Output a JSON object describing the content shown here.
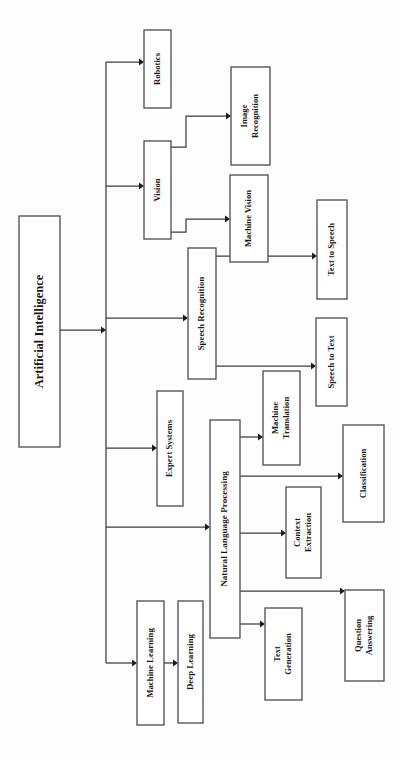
{
  "diagram": {
    "orientation": "rotated-90-ccw",
    "colors": {
      "box_fill": "#ffffff",
      "box_stroke": "#58585a",
      "edge_stroke": "#3b3b3f",
      "text": "#17171a",
      "background": "#fdfdfd"
    },
    "root": {
      "id": "artificial-intelligence",
      "label": "Artificial Intelligence",
      "x": 19,
      "y": 216,
      "w": 41,
      "h": 231,
      "font_size": 12.5,
      "lines": [
        "Artificial Intelligence"
      ]
    },
    "nodes": [
      {
        "id": "robotics",
        "label": "Robotics",
        "x": 144,
        "y": 30,
        "w": 27,
        "h": 78,
        "font_size": 8.6,
        "lines": [
          "Robotics"
        ]
      },
      {
        "id": "vision",
        "label": "Vision",
        "x": 144,
        "y": 141,
        "w": 27,
        "h": 98,
        "font_size": 8.6,
        "lines": [
          "Vision"
        ]
      },
      {
        "id": "image-recognition",
        "label": "Image Recognition",
        "x": 231,
        "y": 67,
        "w": 39,
        "h": 98,
        "font_size": 8.6,
        "lines": [
          "Image",
          "Recognition"
        ]
      },
      {
        "id": "machine-vision",
        "label": "Machine Vision",
        "x": 230,
        "y": 175,
        "w": 38,
        "h": 87,
        "font_size": 8.6,
        "lines": [
          "Machine Vision"
        ]
      },
      {
        "id": "speech-recognition",
        "label": "Speech Recognition",
        "x": 188,
        "y": 248,
        "w": 28,
        "h": 131,
        "font_size": 8.8,
        "lines": [
          "Speech Recognition"
        ]
      },
      {
        "id": "text-to-speech",
        "label": "Text to Speech",
        "x": 317,
        "y": 200,
        "w": 30,
        "h": 99,
        "font_size": 8.6,
        "lines": [
          "Text to Speech"
        ]
      },
      {
        "id": "speech-to-text",
        "label": "Speech to Text",
        "x": 316,
        "y": 318,
        "w": 31,
        "h": 88,
        "font_size": 8.6,
        "lines": [
          "Speech to Text"
        ]
      },
      {
        "id": "expert-systems",
        "label": "Expert Systems",
        "x": 157,
        "y": 391,
        "w": 26,
        "h": 115,
        "font_size": 8.6,
        "lines": [
          "Expert Systems"
        ]
      },
      {
        "id": "natural-language-processing",
        "label": "Natural Language Processing",
        "x": 210,
        "y": 420,
        "w": 30,
        "h": 218,
        "font_size": 9.2,
        "lines": [
          "Natural Language Processing"
        ]
      },
      {
        "id": "machine-translation",
        "label": "Machine Translation",
        "x": 263,
        "y": 371,
        "w": 37,
        "h": 94,
        "font_size": 8.6,
        "lines": [
          "Machine",
          "Translation"
        ]
      },
      {
        "id": "classification",
        "label": "Classification",
        "x": 343,
        "y": 425,
        "w": 41,
        "h": 97,
        "font_size": 8.6,
        "lines": [
          "Classification"
        ]
      },
      {
        "id": "context-extraction",
        "label": "Context Extraction",
        "x": 286,
        "y": 487,
        "w": 35,
        "h": 91,
        "font_size": 8.6,
        "lines": [
          "Context",
          "Extraction"
        ]
      },
      {
        "id": "question-answering",
        "label": "Question Answering",
        "x": 345,
        "y": 590,
        "w": 39,
        "h": 91,
        "font_size": 8.6,
        "lines": [
          "Question",
          "Answering"
        ]
      },
      {
        "id": "text-generation",
        "label": "Text Generation",
        "x": 265,
        "y": 608,
        "w": 37,
        "h": 92,
        "font_size": 8.6,
        "lines": [
          "Text",
          "Generation"
        ]
      },
      {
        "id": "machine-learning",
        "label": "Machine Learning",
        "x": 137,
        "y": 601,
        "w": 27,
        "h": 124,
        "font_size": 8.8,
        "lines": [
          "Machine Learning"
        ]
      },
      {
        "id": "deep-learning",
        "label": "Deep Learning",
        "x": 178,
        "y": 601,
        "w": 25,
        "h": 122,
        "font_size": 8.8,
        "lines": [
          "Deep Learning"
        ]
      }
    ],
    "edges": [
      {
        "id": "ai-to-trunk",
        "from": "artificial-intelligence",
        "to": "trunk",
        "path": "M60,330 L104,330",
        "arrow": {
          "x": 106,
          "y": 330,
          "dir": "right"
        }
      },
      {
        "id": "trunk-spine",
        "from": "trunk",
        "to": "trunk",
        "path": "M106,62 L106,663",
        "arrow": null
      },
      {
        "id": "trunk-to-robotics",
        "from": "trunk",
        "to": "robotics",
        "path": "M106,62 L142,62",
        "arrow": {
          "x": 144,
          "y": 62,
          "dir": "right"
        }
      },
      {
        "id": "trunk-to-vision",
        "from": "trunk",
        "to": "vision",
        "path": "M106,186 L142,186",
        "arrow": {
          "x": 144,
          "y": 186,
          "dir": "right"
        }
      },
      {
        "id": "trunk-to-speech-recognition",
        "from": "trunk",
        "to": "speech-recognition",
        "path": "M106,318 L186,318",
        "arrow": {
          "x": 188,
          "y": 318,
          "dir": "right"
        }
      },
      {
        "id": "trunk-to-expert-systems",
        "from": "trunk",
        "to": "expert-systems",
        "path": "M106,448 L155,448",
        "arrow": {
          "x": 157,
          "y": 448,
          "dir": "right"
        }
      },
      {
        "id": "trunk-to-nlp",
        "from": "trunk",
        "to": "natural-language-processing",
        "path": "M106,527 L208,527",
        "arrow": {
          "x": 210,
          "y": 527,
          "dir": "right"
        }
      },
      {
        "id": "trunk-to-machine-learning",
        "from": "trunk",
        "to": "machine-learning",
        "path": "M106,663 L135,663",
        "arrow": {
          "x": 137,
          "y": 663,
          "dir": "right"
        }
      },
      {
        "id": "vision-to-image-recognition",
        "from": "vision",
        "to": "image-recognition",
        "path": "M171,147 L186,147 L186,116 L229,116",
        "arrow": {
          "x": 231,
          "y": 116,
          "dir": "right"
        }
      },
      {
        "id": "vision-to-machine-vision",
        "from": "vision",
        "to": "machine-vision",
        "path": "M171,232 L186,232 L186,219 L228,219",
        "arrow": {
          "x": 230,
          "y": 219,
          "dir": "right"
        }
      },
      {
        "id": "speech-recognition-to-text-to-speech",
        "from": "speech-recognition",
        "to": "text-to-speech",
        "path": "M216,256 L315,256",
        "arrow": {
          "x": 317,
          "y": 256,
          "dir": "right"
        }
      },
      {
        "id": "speech-recognition-to-speech-to-text",
        "from": "speech-recognition",
        "to": "speech-to-text",
        "path": "M216,366 L314,366",
        "arrow": {
          "x": 316,
          "y": 366,
          "dir": "right"
        }
      },
      {
        "id": "nlp-to-machine-translation",
        "from": "natural-language-processing",
        "to": "machine-translation",
        "path": "M240,437 L261,437",
        "arrow": {
          "x": 263,
          "y": 437,
          "dir": "right"
        }
      },
      {
        "id": "nlp-to-classification",
        "from": "natural-language-processing",
        "to": "classification",
        "path": "M240,476 L341,476",
        "arrow": {
          "x": 343,
          "y": 476,
          "dir": "right"
        }
      },
      {
        "id": "nlp-to-context-extraction",
        "from": "natural-language-processing",
        "to": "context-extraction",
        "path": "M240,533 L284,533",
        "arrow": {
          "x": 286,
          "y": 533,
          "dir": "right"
        }
      },
      {
        "id": "nlp-to-question-answering",
        "from": "natural-language-processing",
        "to": "question-answering",
        "path": "M240,591 L343,591",
        "arrow": {
          "x": 345,
          "y": 591,
          "dir": "right"
        }
      },
      {
        "id": "nlp-to-text-generation",
        "from": "natural-language-processing",
        "to": "text-generation",
        "path": "M240,624 L263,624",
        "arrow": {
          "x": 265,
          "y": 624,
          "dir": "right"
        }
      },
      {
        "id": "machine-learning-to-deep-learning",
        "from": "machine-learning",
        "to": "deep-learning",
        "path": "M164,663 L176,663",
        "arrow": {
          "x": 178,
          "y": 663,
          "dir": "right"
        }
      }
    ]
  }
}
